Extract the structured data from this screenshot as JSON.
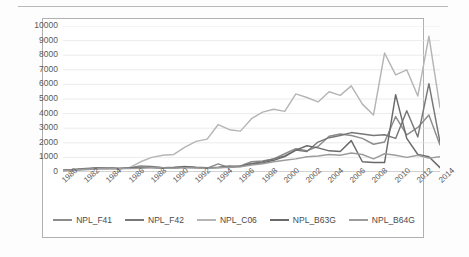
{
  "chart_data": {
    "type": "line",
    "title": "",
    "xlabel": "",
    "ylabel": "",
    "ylim": [
      0,
      10000
    ],
    "ytick_labels": [
      "10000",
      "9000",
      "8000",
      "7000",
      "6000",
      "5000",
      "4000",
      "3000",
      "2000",
      "1000",
      "0"
    ],
    "ytick_values": [
      10000,
      9000,
      8000,
      7000,
      6000,
      5000,
      4000,
      3000,
      2000,
      1000,
      0
    ],
    "grid": true,
    "legend_position": "bottom",
    "x": [
      1980,
      1981,
      1982,
      1983,
      1984,
      1985,
      1986,
      1987,
      1988,
      1989,
      1990,
      1991,
      1992,
      1993,
      1994,
      1995,
      1996,
      1997,
      1998,
      1999,
      2000,
      2001,
      2002,
      2003,
      2004,
      2005,
      2006,
      2007,
      2008,
      2009,
      2010,
      2011,
      2012,
      2013,
      2014
    ],
    "xtick_labels": [
      "1980",
      "1982",
      "1984",
      "1986",
      "1988",
      "1990",
      "1992",
      "1994",
      "1996",
      "1998",
      "2000",
      "2002",
      "2004",
      "2006",
      "2008",
      "2010",
      "2012",
      "2014"
    ],
    "series": [
      {
        "name": "NPL_F41",
        "color": "#8c8c8c",
        "values": [
          120,
          180,
          240,
          300,
          260,
          220,
          300,
          420,
          380,
          300,
          330,
          380,
          300,
          260,
          560,
          300,
          420,
          700,
          760,
          900,
          1250,
          1600,
          1450,
          1750,
          2450,
          2600,
          2500,
          2300,
          1900,
          2050,
          3800,
          2550,
          3050,
          3900,
          1850
        ]
      },
      {
        "name": "NPL_F42",
        "color": "#777777",
        "values": [
          100,
          150,
          200,
          260,
          300,
          240,
          260,
          300,
          340,
          300,
          280,
          320,
          300,
          280,
          330,
          420,
          380,
          560,
          700,
          900,
          1100,
          1500,
          1400,
          2050,
          2350,
          2500,
          2700,
          2600,
          2500,
          2550,
          2300,
          4200,
          2400,
          6050,
          2050
        ]
      },
      {
        "name": "NPL_C06",
        "color": "#b5b5b5",
        "values": [
          90,
          120,
          160,
          200,
          180,
          210,
          300,
          700,
          1000,
          1150,
          1200,
          1700,
          2100,
          2250,
          3250,
          2900,
          2800,
          3650,
          4100,
          4300,
          4150,
          5350,
          5100,
          4800,
          5500,
          5250,
          5900,
          4650,
          3900,
          8150,
          6650,
          7000,
          5200,
          9300,
          4400
        ]
      },
      {
        "name": "NPL_B63G",
        "color": "#6a6a6a",
        "values": [
          110,
          160,
          210,
          250,
          300,
          240,
          280,
          330,
          300,
          260,
          300,
          360,
          320,
          300,
          300,
          340,
          400,
          560,
          620,
          800,
          1050,
          1500,
          1800,
          1650,
          1450,
          1400,
          2150,
          700,
          650,
          650,
          5300,
          2300,
          1200,
          1050,
          300
        ]
      },
      {
        "name": "NPL_B64G",
        "color": "#9c9c9c",
        "values": [
          95,
          140,
          190,
          230,
          270,
          250,
          230,
          260,
          300,
          280,
          260,
          300,
          280,
          260,
          290,
          330,
          360,
          480,
          560,
          700,
          800,
          900,
          1050,
          1100,
          1200,
          1150,
          1300,
          1200,
          900,
          1250,
          1150,
          1000,
          1150,
          950,
          1050
        ]
      }
    ]
  },
  "legend": {
    "items": [
      {
        "label": "NPL_F41"
      },
      {
        "label": "NPL_F42"
      },
      {
        "label": "NPL_C06"
      },
      {
        "label": "NPL_B63G"
      },
      {
        "label": "NPL_B64G"
      }
    ]
  }
}
